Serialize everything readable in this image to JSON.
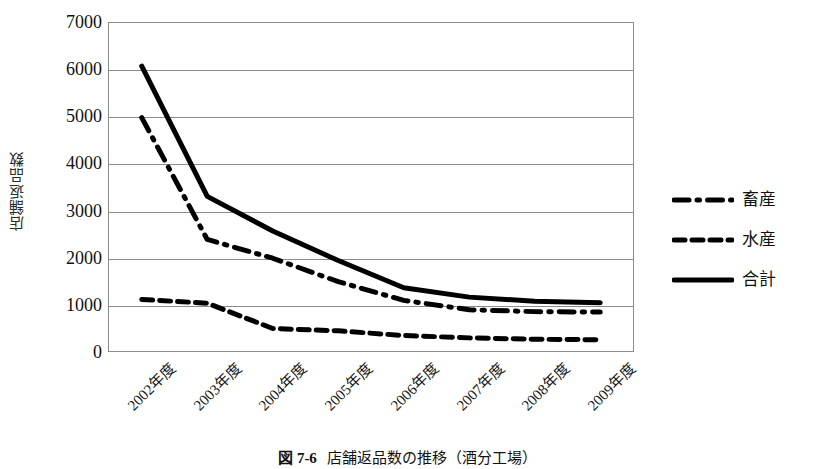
{
  "chart_data": {
    "type": "line",
    "title": "店舗返品数の推移（酒分工場）",
    "xlabel": "",
    "ylabel": "店舗返品数",
    "categories": [
      "2002年度",
      "2003年度",
      "2004年度",
      "2005年度",
      "2006年度",
      "2007年度",
      "2008年度",
      "2009年度"
    ],
    "series": [
      {
        "name": "畜産",
        "style": "dash-dot",
        "color": "#000000",
        "values": [
          4980,
          2380,
          1980,
          1480,
          1080,
          880,
          840,
          830
        ]
      },
      {
        "name": "水産",
        "style": "dashed",
        "color": "#000000",
        "values": [
          1100,
          1020,
          480,
          430,
          330,
          280,
          250,
          240
        ]
      },
      {
        "name": "合計",
        "style": "solid",
        "color": "#000000",
        "values": [
          6080,
          3300,
          2560,
          1930,
          1350,
          1150,
          1060,
          1030
        ]
      }
    ],
    "ylim": [
      0,
      7000
    ],
    "ytick_labels": [
      "0",
      "1000",
      "2000",
      "3000",
      "4000",
      "5000",
      "6000",
      "7000"
    ],
    "ytick_values": [
      0,
      1000,
      2000,
      3000,
      4000,
      5000,
      6000,
      7000
    ],
    "grid": true,
    "legend_position": "right"
  },
  "caption": {
    "number": "図 7-6",
    "text": "店舗返品数の推移（酒分工場）"
  }
}
